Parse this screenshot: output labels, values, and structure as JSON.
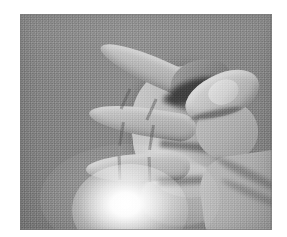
{
  "page": {
    "background_color": "#ffffff",
    "margin_left_px": 20,
    "margin_top_px": 14
  },
  "figure": {
    "kind": "photograph",
    "medium": "halftone-printed grayscale photograph",
    "color_mode": "grayscale",
    "caption": "",
    "gesture": "three fingers extended, thumb touching bent index finger",
    "hand": "right hand",
    "orientation": "fingers pointing left, wrist exiting lower right",
    "plate": {
      "x_px": 20,
      "y_px": 14,
      "width_px": 252,
      "height_px": 216
    },
    "palette": {
      "backdrop_gray": "#8d8d8d",
      "skin_light": "#d4d2ce",
      "skin_mid": "#b9b8b6",
      "skin_shadow": "#9a9895",
      "deep_shadow": "#6f6d6b",
      "glare_white": "#ffffff",
      "plate_border": "#787878"
    },
    "features": [
      {
        "name": "middle-finger",
        "label": "extended middle finger"
      },
      {
        "name": "ring-finger",
        "label": "extended ring finger"
      },
      {
        "name": "little-finger",
        "label": "extended little finger"
      },
      {
        "name": "index-finger",
        "label": "bent index finger"
      },
      {
        "name": "thumb",
        "label": "thumb curled to index fingertip"
      },
      {
        "name": "palm",
        "label": "palm of hand"
      },
      {
        "name": "wrist",
        "label": "wrist"
      },
      {
        "name": "lamp-glare",
        "label": "specular lamp glare"
      }
    ]
  }
}
